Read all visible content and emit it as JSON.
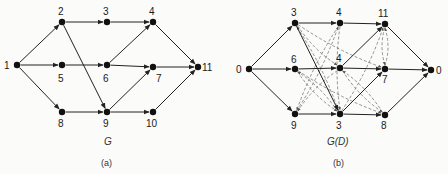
{
  "graph_a": {
    "title": "G",
    "caption": "(a)",
    "nodes": [
      {
        "id": "1",
        "label": "1",
        "x": 17,
        "y": 65,
        "lx": 4,
        "ly": 69
      },
      {
        "id": "2",
        "label": "2",
        "x": 62,
        "y": 22,
        "lx": 58,
        "ly": 15
      },
      {
        "id": "3",
        "label": "3",
        "x": 107,
        "y": 22,
        "lx": 103,
        "ly": 15
      },
      {
        "id": "4",
        "label": "4",
        "x": 153,
        "y": 22,
        "lx": 149,
        "ly": 15
      },
      {
        "id": "5",
        "label": "5",
        "x": 62,
        "y": 65,
        "lx": 58,
        "ly": 82
      },
      {
        "id": "6",
        "label": "6",
        "x": 107,
        "y": 65,
        "lx": 103,
        "ly": 82
      },
      {
        "id": "7",
        "label": "7",
        "x": 153,
        "y": 67,
        "lx": 156,
        "ly": 82
      },
      {
        "id": "8",
        "label": "8",
        "x": 62,
        "y": 112,
        "lx": 58,
        "ly": 127
      },
      {
        "id": "9",
        "label": "9",
        "x": 107,
        "y": 112,
        "lx": 103,
        "ly": 127
      },
      {
        "id": "10",
        "label": "10",
        "x": 153,
        "y": 112,
        "lx": 146,
        "ly": 127
      },
      {
        "id": "11",
        "label": "11",
        "x": 198,
        "y": 67,
        "lx": 202,
        "ly": 71
      }
    ],
    "edges": [
      [
        "1",
        "2"
      ],
      [
        "1",
        "5"
      ],
      [
        "1",
        "8"
      ],
      [
        "2",
        "3"
      ],
      [
        "2",
        "9"
      ],
      [
        "3",
        "4"
      ],
      [
        "5",
        "6"
      ],
      [
        "6",
        "4"
      ],
      [
        "6",
        "7"
      ],
      [
        "8",
        "9"
      ],
      [
        "9",
        "7"
      ],
      [
        "9",
        "10"
      ],
      [
        "4",
        "11"
      ],
      [
        "7",
        "11"
      ],
      [
        "10",
        "11"
      ]
    ]
  },
  "graph_b": {
    "title": "G(D)",
    "caption": "(b)",
    "nodes": [
      {
        "id": "s",
        "label": "0",
        "x": 249,
        "y": 69,
        "lx": 236,
        "ly": 73
      },
      {
        "id": "a",
        "label": "3",
        "x": 295,
        "y": 23,
        "lx": 291,
        "ly": 16
      },
      {
        "id": "b",
        "label": "4",
        "x": 340,
        "y": 23,
        "lx": 336,
        "ly": 16
      },
      {
        "id": "c",
        "label": "11",
        "x": 385,
        "y": 24,
        "lx": 378,
        "ly": 17
      },
      {
        "id": "d",
        "label": "6",
        "x": 295,
        "y": 69,
        "lx": 291,
        "ly": 63
      },
      {
        "id": "e",
        "label": "4",
        "x": 340,
        "y": 68,
        "lx": 336,
        "ly": 62
      },
      {
        "id": "f",
        "label": "7",
        "x": 385,
        "y": 69,
        "lx": 382,
        "ly": 83
      },
      {
        "id": "t",
        "label": "0",
        "x": 431,
        "y": 70,
        "lx": 436,
        "ly": 74
      },
      {
        "id": "g",
        "label": "9",
        "x": 295,
        "y": 114,
        "lx": 291,
        "ly": 129
      },
      {
        "id": "h",
        "label": "3",
        "x": 340,
        "y": 114,
        "lx": 336,
        "ly": 129
      },
      {
        "id": "i",
        "label": "8",
        "x": 385,
        "y": 115,
        "lx": 381,
        "ly": 129
      }
    ],
    "solid_edges": [
      [
        "s",
        "a"
      ],
      [
        "s",
        "d"
      ],
      [
        "s",
        "g"
      ],
      [
        "a",
        "b"
      ],
      [
        "b",
        "c"
      ],
      [
        "a",
        "h"
      ],
      [
        "d",
        "e"
      ],
      [
        "e",
        "f"
      ],
      [
        "f",
        "t"
      ],
      [
        "g",
        "h"
      ],
      [
        "h",
        "i"
      ],
      [
        "h",
        "f"
      ],
      [
        "e",
        "c"
      ],
      [
        "c",
        "t"
      ],
      [
        "i",
        "t"
      ]
    ],
    "dashed_edges": [
      [
        "a",
        "e"
      ],
      [
        "a",
        "f"
      ],
      [
        "b",
        "g"
      ],
      [
        "b",
        "h"
      ],
      [
        "d",
        "h"
      ],
      [
        "d",
        "i"
      ],
      [
        "e",
        "g"
      ],
      [
        "e",
        "i"
      ],
      [
        "h",
        "c"
      ],
      [
        "g",
        "b"
      ],
      [
        "c",
        "f"
      ],
      [
        "f",
        "c"
      ],
      [
        "h",
        "a"
      ],
      [
        "i",
        "e"
      ],
      [
        "h",
        "d"
      ]
    ]
  }
}
